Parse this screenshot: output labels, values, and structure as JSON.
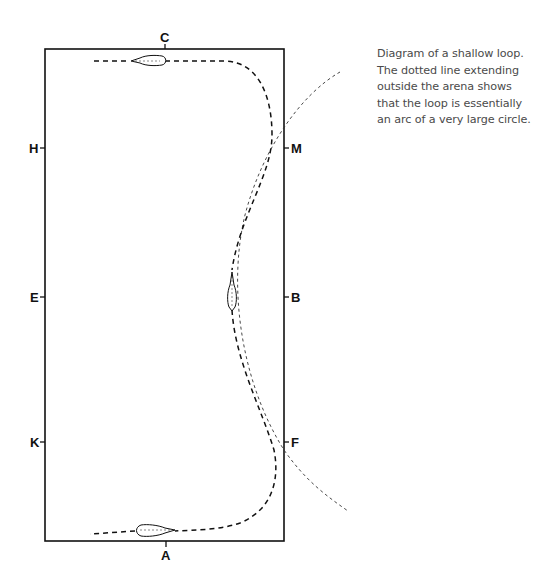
{
  "figure": {
    "caption": "Diagram of a shallow loop. The dotted line extending outside the arena shows that the loop is essentially an arc of a very large circle.",
    "arena_markers": {
      "top": "C",
      "bottom": "A",
      "left": [
        "H",
        "E",
        "K"
      ],
      "right": [
        "M",
        "B",
        "F"
      ]
    },
    "elements": {
      "arena": "rectangle-arena-outline",
      "route": "dashed-shallow-loop-path",
      "circle_arc": "dotted-large-circle-arc",
      "horses": [
        "horse-at-C",
        "horse-at-B-line",
        "horse-at-A"
      ]
    }
  }
}
